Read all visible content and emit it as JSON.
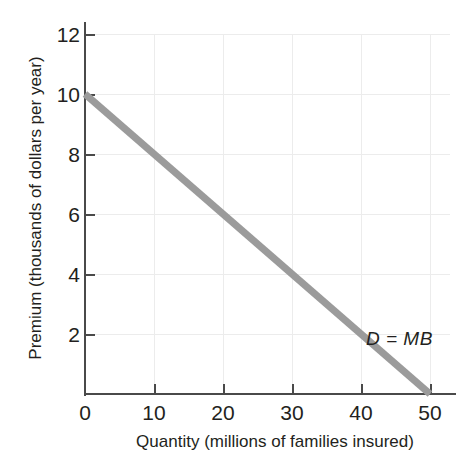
{
  "chart_data": {
    "type": "line",
    "title": "",
    "subtitle": "",
    "xlabel": "Quantity (millions of families insured)",
    "ylabel": "Premium (thousands of dollars per year)",
    "xlim": [
      0,
      50
    ],
    "ylim": [
      0,
      12
    ],
    "xticks": [
      0,
      10,
      20,
      30,
      40,
      50
    ],
    "yticks": [
      0,
      2,
      4,
      6,
      8,
      10,
      12
    ],
    "xtick_labels": [
      "0",
      "10",
      "20",
      "30",
      "40",
      "50"
    ],
    "ytick_labels": [
      "0",
      "2",
      "4",
      "6",
      "8",
      "10",
      "12"
    ],
    "grid": true,
    "grid_axis": "both",
    "legend": "none",
    "series": [
      {
        "name": "D = MB",
        "label": "D = MB",
        "color": "#9b9b9b",
        "linewidth": 7,
        "x": [
          0,
          50
        ],
        "values": [
          10,
          0
        ],
        "points": [
          {
            "x": 0,
            "y": 10
          },
          {
            "x": 10,
            "y": 8
          },
          {
            "x": 20,
            "y": 6
          },
          {
            "x": 30,
            "y": 4
          },
          {
            "x": 40,
            "y": 2
          },
          {
            "x": 50,
            "y": 0
          }
        ]
      }
    ],
    "annotations": [
      {
        "text": "D = MB",
        "x": 45,
        "y": 1.9,
        "style": "italic"
      }
    ]
  },
  "axes": {
    "y_title": "Premium (thousands of dollars per year)",
    "x_title": "Quantity (millions of families insured)",
    "x_tick_labels": [
      "0",
      "10",
      "20",
      "30",
      "40",
      "50"
    ],
    "y_tick_labels": [
      "2",
      "4",
      "6",
      "8",
      "10",
      "12"
    ],
    "y_origin_label": "0"
  },
  "annotation": {
    "demand_curve_label": "D = MB"
  },
  "colors": {
    "line": "#9b9b9b",
    "axis": "#4a4a4a",
    "grid": "#ececec",
    "text": "#231f20",
    "background": "#ffffff"
  }
}
